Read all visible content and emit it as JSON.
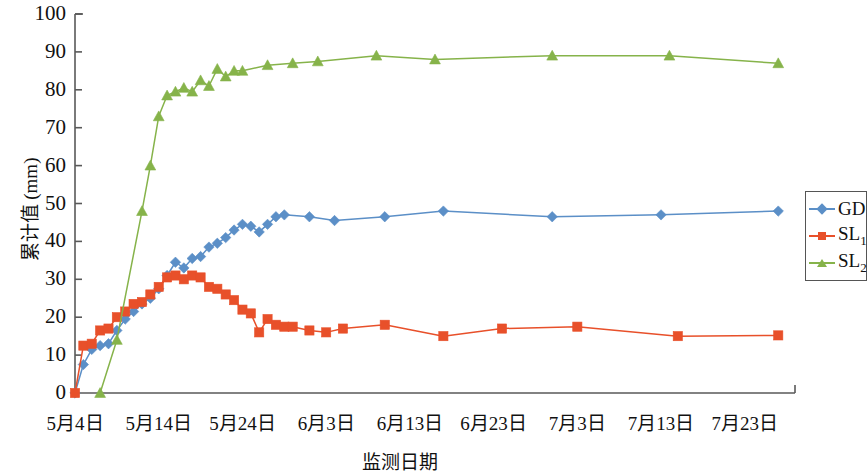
{
  "chart_data": {
    "type": "line",
    "title": "",
    "xlabel": "监测日期",
    "ylabel": "累计值 (mm)",
    "ylim": [
      0,
      100
    ],
    "ytick_values": [
      0,
      10,
      20,
      30,
      40,
      50,
      60,
      70,
      80,
      90,
      100
    ],
    "xtick_labels": [
      "5月4日",
      "5月14日",
      "5月24日",
      "6月3日",
      "6月13日",
      "6月23日",
      "7月3日",
      "7月13日",
      "7月23日"
    ],
    "xtick_days": [
      0,
      10,
      20,
      30,
      40,
      50,
      60,
      70,
      80
    ],
    "xlim_days": [
      0,
      86
    ],
    "grid": false,
    "legend_position": "right",
    "colors": {
      "GD": "#5b8fc7",
      "SL1": "#e8502a",
      "SL2": "#86b34a",
      "axis": "#595959"
    },
    "series": [
      {
        "name": "GD",
        "marker": "diamond",
        "color": "#5b8fc7",
        "points": [
          [
            0,
            0.0
          ],
          [
            1,
            7.5
          ],
          [
            2,
            11.5
          ],
          [
            3,
            12.5
          ],
          [
            4,
            13.0
          ],
          [
            5,
            16.5
          ],
          [
            6,
            19.5
          ],
          [
            7,
            21.5
          ],
          [
            8,
            23.5
          ],
          [
            9,
            25.0
          ],
          [
            10,
            27.5
          ],
          [
            11,
            31.0
          ],
          [
            12,
            34.5
          ],
          [
            13,
            33.0
          ],
          [
            14,
            35.5
          ],
          [
            15,
            36.0
          ],
          [
            16,
            38.5
          ],
          [
            17,
            39.5
          ],
          [
            18,
            41.0
          ],
          [
            19,
            43.0
          ],
          [
            20,
            44.5
          ],
          [
            21,
            44.0
          ],
          [
            22,
            42.5
          ],
          [
            23,
            44.5
          ],
          [
            24,
            46.5
          ],
          [
            25,
            47.0
          ],
          [
            28,
            46.5
          ],
          [
            31,
            45.5
          ],
          [
            37,
            46.5
          ],
          [
            44,
            48.0
          ],
          [
            57,
            46.5
          ],
          [
            70,
            47.0
          ],
          [
            84,
            48.0
          ]
        ]
      },
      {
        "name": "SL1",
        "marker": "square",
        "color": "#e8502a",
        "points": [
          [
            0,
            0.0
          ],
          [
            1,
            12.5
          ],
          [
            2,
            13.0
          ],
          [
            3,
            16.5
          ],
          [
            4,
            17.0
          ],
          [
            5,
            20.0
          ],
          [
            6,
            21.5
          ],
          [
            7,
            23.5
          ],
          [
            8,
            24.0
          ],
          [
            9,
            26.0
          ],
          [
            10,
            28.0
          ],
          [
            11,
            30.5
          ],
          [
            12,
            31.0
          ],
          [
            13,
            30.0
          ],
          [
            14,
            31.0
          ],
          [
            15,
            30.5
          ],
          [
            16,
            28.0
          ],
          [
            17,
            27.5
          ],
          [
            18,
            26.0
          ],
          [
            19,
            24.5
          ],
          [
            20,
            22.0
          ],
          [
            21,
            21.0
          ],
          [
            22,
            16.0
          ],
          [
            23,
            19.5
          ],
          [
            24,
            18.0
          ],
          [
            25,
            17.5
          ],
          [
            26,
            17.5
          ],
          [
            28,
            16.5
          ],
          [
            30,
            16.0
          ],
          [
            32,
            17.0
          ],
          [
            37,
            18.0
          ],
          [
            44,
            15.0
          ],
          [
            51,
            17.0
          ],
          [
            60,
            17.5
          ],
          [
            72,
            15.0
          ],
          [
            84,
            15.2
          ]
        ]
      },
      {
        "name": "SL2",
        "marker": "triangle",
        "color": "#86b34a",
        "points": [
          [
            3,
            0.0
          ],
          [
            5,
            14.0
          ],
          [
            8,
            48.0
          ],
          [
            9,
            60.0
          ],
          [
            10,
            73.0
          ],
          [
            11,
            78.5
          ],
          [
            12,
            79.5
          ],
          [
            13,
            80.5
          ],
          [
            14,
            79.5
          ],
          [
            15,
            82.5
          ],
          [
            16,
            81.0
          ],
          [
            17,
            85.5
          ],
          [
            18,
            83.5
          ],
          [
            19,
            85.0
          ],
          [
            20,
            85.0
          ],
          [
            23,
            86.5
          ],
          [
            26,
            87.0
          ],
          [
            29,
            87.5
          ],
          [
            36,
            89.0
          ],
          [
            43,
            88.0
          ],
          [
            57,
            89.0
          ],
          [
            71,
            89.0
          ],
          [
            84,
            87.0
          ]
        ]
      }
    ]
  },
  "legend": {
    "items": [
      {
        "label": "GD",
        "sub": "",
        "marker": "diamond",
        "color": "#5b8fc7"
      },
      {
        "label": "SL",
        "sub": "1",
        "marker": "square",
        "color": "#e8502a"
      },
      {
        "label": "SL",
        "sub": "2",
        "marker": "triangle",
        "color": "#86b34a"
      }
    ]
  }
}
